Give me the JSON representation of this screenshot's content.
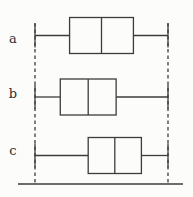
{
  "chart_data": {
    "type": "boxplot",
    "orientation": "horizontal",
    "title": "",
    "xlabel": "",
    "ylabel": "",
    "categories": [
      "a",
      "b",
      "c"
    ],
    "xlim": [
      0,
      1
    ],
    "grid": false,
    "legend": false,
    "axis_tick_labels": [],
    "shared_whisker_extremes": true,
    "dashed_guides_at": [
      0,
      1
    ],
    "series": [
      {
        "name": "a",
        "min": 0,
        "q1": 0.26,
        "median": 0.5,
        "q3": 0.74,
        "max": 1
      },
      {
        "name": "b",
        "min": 0,
        "q1": 0.19,
        "median": 0.4,
        "q3": 0.61,
        "max": 1
      },
      {
        "name": "c",
        "min": 0,
        "q1": 0.4,
        "median": 0.6,
        "q3": 0.8,
        "max": 1
      }
    ],
    "line_color": "#3c3c3c",
    "box_fill": "#fcfcfb",
    "background": "#fcfcfb"
  }
}
